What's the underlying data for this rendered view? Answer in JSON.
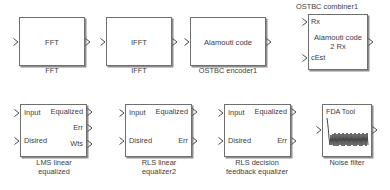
{
  "diagram": {
    "background_color": "#ffffff",
    "block_border_color": "#6f6f6f",
    "text_color": "#3c3c3c",
    "shadow_color": "#8d8d8d"
  },
  "blocks": [
    {
      "id": "fft",
      "center_text": "FFT",
      "caption": "FFT",
      "caption_position": "bottom",
      "inputs": [
        {
          "label": ""
        }
      ],
      "outputs": [
        {
          "label": ""
        }
      ]
    },
    {
      "id": "ifft",
      "center_text": "IFFT",
      "caption": "IFFT",
      "caption_position": "bottom",
      "inputs": [
        {
          "label": ""
        }
      ],
      "outputs": [
        {
          "label": ""
        }
      ]
    },
    {
      "id": "ostbc-encoder1",
      "center_text": "Alamouti code",
      "caption": "OSTBC encoder1",
      "caption_position": "bottom",
      "inputs": [
        {
          "label": ""
        }
      ],
      "outputs": [
        {
          "label": ""
        }
      ]
    },
    {
      "id": "ostbc-combiner1",
      "center_text": "Alamouti code\n2 Rx",
      "caption": "OSTBC combiner1",
      "caption_position": "top",
      "inputs": [
        {
          "label": "Rx"
        },
        {
          "label": "cEst"
        }
      ],
      "outputs": [
        {
          "label": ""
        }
      ]
    },
    {
      "id": "lms-linear-equalized",
      "center_text": "",
      "caption": "LMS linear\nequalized",
      "caption_position": "bottom",
      "inputs": [
        {
          "label": "Input"
        },
        {
          "label": "Disired"
        }
      ],
      "outputs": [
        {
          "label": "Equalized"
        },
        {
          "label": "Err"
        },
        {
          "label": "Wts"
        }
      ]
    },
    {
      "id": "rls-linear-equalizer2",
      "center_text": "",
      "caption": "RLS linear\nequalizer2",
      "caption_position": "bottom",
      "inputs": [
        {
          "label": "Input"
        },
        {
          "label": "Disired"
        }
      ],
      "outputs": [
        {
          "label": "Equalized"
        },
        {
          "label": "Err"
        }
      ]
    },
    {
      "id": "rls-decision-feedback-equalizer",
      "center_text": "",
      "caption": "RLS decision\nfeedback equalizer",
      "caption_position": "bottom",
      "inputs": [
        {
          "label": "Input"
        },
        {
          "label": "Disired"
        }
      ],
      "outputs": [
        {
          "label": "Equalized"
        },
        {
          "label": "Err"
        }
      ]
    },
    {
      "id": "noise-filter",
      "center_text": "",
      "inner_label": "FDA Tool",
      "caption": "Noise filter",
      "caption_position": "bottom",
      "inputs": [
        {
          "label": ""
        }
      ],
      "outputs": [
        {
          "label": ""
        }
      ]
    }
  ]
}
